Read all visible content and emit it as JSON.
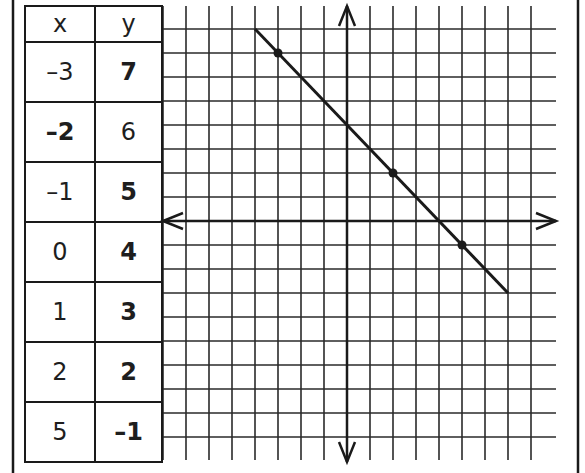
{
  "table": {
    "headers": {
      "x": "x",
      "y": "y"
    },
    "rows": [
      {
        "x": "–3",
        "y": "7",
        "x_bold": false,
        "y_bold": true
      },
      {
        "x": "–2",
        "y": "6",
        "x_bold": true,
        "y_bold": false
      },
      {
        "x": "–1",
        "y": "5",
        "x_bold": false,
        "y_bold": true
      },
      {
        "x": "0",
        "y": "4",
        "x_bold": false,
        "y_bold": true
      },
      {
        "x": "1",
        "y": "3",
        "x_bold": false,
        "y_bold": true
      },
      {
        "x": "2",
        "y": "2",
        "x_bold": false,
        "y_bold": true
      },
      {
        "x": "5",
        "y": "–1",
        "x_bold": false,
        "y_bold": true
      }
    ]
  },
  "graph": {
    "grid": {
      "x_range": [
        -8,
        8
      ],
      "y_range": [
        -9,
        8
      ],
      "unit_px_x": 23,
      "unit_px_y": 24
    },
    "line": {
      "from": [
        -4,
        8
      ],
      "to": [
        7,
        -3
      ],
      "equation": "y = -x + 4"
    },
    "plotted_points": [
      [
        -3,
        7
      ],
      [
        2,
        2
      ],
      [
        5,
        -1
      ]
    ],
    "colors": {
      "ink": "#1a1a1a",
      "grid": "#2a2a2a",
      "background": "#ffffff"
    }
  }
}
